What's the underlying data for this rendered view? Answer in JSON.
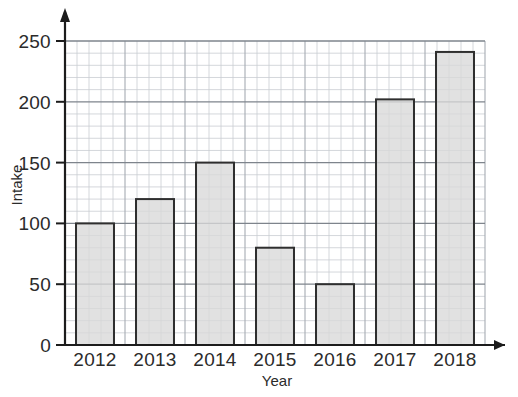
{
  "chart_data": {
    "type": "bar",
    "title": "",
    "xlabel": "Year",
    "ylabel": "Intake",
    "categories": [
      "2012",
      "2013",
      "2014",
      "2015",
      "2016",
      "2017",
      "2018"
    ],
    "values": [
      100,
      120,
      150,
      80,
      50,
      202,
      241
    ],
    "ylim": [
      0,
      250
    ],
    "ytick_labels": [
      "0",
      "50",
      "100",
      "150",
      "200",
      "250"
    ],
    "ytick_values": [
      0,
      50,
      100,
      150,
      200,
      250
    ],
    "grid": "on",
    "grid_minor_step": 10,
    "legend": "none",
    "bar_fill_color": "#d9d9d9",
    "bar_border_color": "#2f2f2f",
    "axis_color": "#1c1c1c"
  },
  "axes": {
    "y_title": "Intake",
    "x_title": "Year"
  }
}
